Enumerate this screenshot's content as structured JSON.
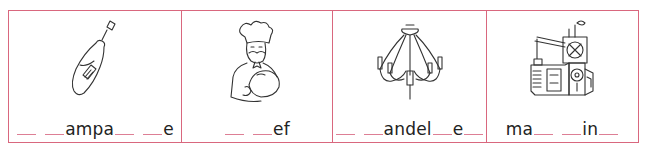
{
  "worksheet": {
    "border_color": "#d9677e",
    "blank_color": "#dd7f95",
    "items": [
      {
        "image": "champagne-bottle-icon",
        "parts": [
          "_",
          " ",
          "_",
          "ampa",
          "_",
          " ",
          "_",
          "e"
        ],
        "answer_pattern": "__ __ampa__ __e"
      },
      {
        "image": "chef-icon",
        "parts": [
          "_",
          " ",
          "_",
          "ef"
        ],
        "answer_pattern": "__ __ef"
      },
      {
        "image": "chandelier-icon",
        "parts": [
          "_",
          " ",
          "_",
          "andel",
          "_",
          "e",
          "_"
        ],
        "answer_pattern": "__ __andel__e__"
      },
      {
        "image": "machine-icon",
        "parts": [
          "ma",
          "_",
          " ",
          "_",
          "in",
          "_"
        ],
        "answer_pattern": "ma__ __in__"
      }
    ]
  }
}
